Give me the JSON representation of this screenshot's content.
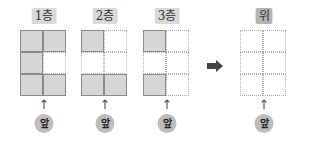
{
  "panels": [
    {
      "label": "1층",
      "front_label": "앞",
      "up_arrow": "↑",
      "cells": [
        [
          1,
          1
        ],
        [
          1,
          0
        ],
        [
          1,
          1
        ]
      ]
    },
    {
      "label": "2층",
      "front_label": "앞",
      "up_arrow": "↑",
      "cells": [
        [
          1,
          0
        ],
        [
          0,
          0
        ],
        [
          1,
          1
        ]
      ]
    },
    {
      "label": "3층",
      "front_label": "앞",
      "up_arrow": "↑",
      "cells": [
        [
          1,
          0
        ],
        [
          0,
          0
        ],
        [
          1,
          0
        ]
      ]
    },
    {
      "label": "위",
      "front_label": "앞",
      "up_arrow": "↑",
      "cells": [
        [
          0,
          0
        ],
        [
          0,
          0
        ],
        [
          0,
          0
        ]
      ]
    }
  ],
  "arrow_icon": "right-arrow-icon",
  "colors": {
    "filled": "#d6d6d6",
    "label_bg": "#d9d9d9",
    "top_label_bg": "#b5b5b5",
    "front_circle": "#bdbdbd"
  }
}
